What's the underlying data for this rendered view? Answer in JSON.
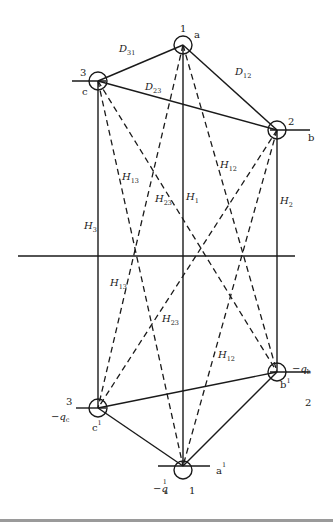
{
  "diagram": {
    "nodes": {
      "top": [
        {
          "id": "1",
          "phase": "a",
          "cx": 183,
          "cy": 45
        },
        {
          "id": "2",
          "phase": "b",
          "cx": 277,
          "cy": 130
        },
        {
          "id": "3",
          "phase": "c",
          "cx": 98,
          "cy": 81
        }
      ],
      "image": [
        {
          "id": "1",
          "phase": "a¹",
          "charge": "−q¹a",
          "cx": 183,
          "cy": 466
        },
        {
          "id": "2",
          "phase": "b¹",
          "charge": "−qb",
          "cx": 277,
          "cy": 372
        },
        {
          "id": "3",
          "phase": "c¹",
          "charge": "−qc",
          "cx": 98,
          "cy": 408
        }
      ]
    },
    "labels": {
      "n1_top": "1",
      "a_top": "a",
      "n2_top": "2",
      "b_top": "b",
      "n3_top": "3",
      "c_top": "c",
      "n1_bot": "1",
      "a_bot": "a",
      "a_bot_sup": "1",
      "n2_bot": "2",
      "b_bot": "b",
      "b_bot_sup": "1",
      "n3_bot": "3",
      "c_bot": "c",
      "c_bot_sup": "1",
      "qa_main": "−q",
      "qa_sup": "1",
      "qa_sub": "a",
      "qb_main": "−q",
      "qb_sub": "b",
      "qc_main": "−q",
      "qc_sub": "c",
      "D": "D",
      "H": "H",
      "D31_sub": "31",
      "D12_sub": "12",
      "D23_sub": "23",
      "H1_sub": "1",
      "H2_sub": "2",
      "H3_sub": "3",
      "H12_sub": "12",
      "H13_sub": "13",
      "H23_sub": "23"
    },
    "ground_line": {
      "x1": 18,
      "x2": 295,
      "y": 256
    }
  }
}
